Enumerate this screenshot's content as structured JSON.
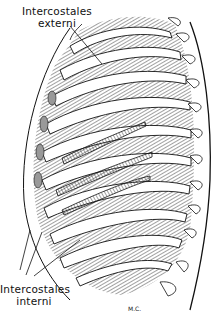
{
  "figure": {
    "labels": {
      "top": {
        "line1": "Intercostales",
        "line2": "externi"
      },
      "bottom": {
        "line1": "Intercostales",
        "line2": "interni"
      }
    },
    "signature": "M.C."
  },
  "colors": {
    "ink": "#111111",
    "paper": "#ffffff"
  }
}
